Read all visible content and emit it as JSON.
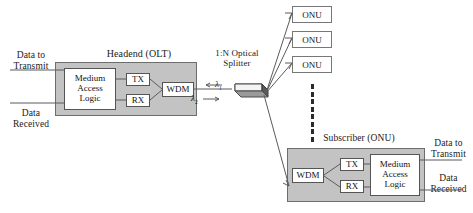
{
  "diagram": {
    "headend": {
      "title": "Headend (OLT)",
      "mac_label": "Medium\nAccess\nLogic",
      "tx_label": "TX",
      "rx_label": "RX",
      "wdm_label": "WDM",
      "left_top_label": "Data to\nTransmit",
      "left_bottom_label": "Data\nReceived"
    },
    "splitter": {
      "title": "1:N Optical\nSplitter",
      "lambda_up": "λ",
      "lambda_up_sub": "1",
      "lambda_down": "λ",
      "lambda_down_sub": "2",
      "arrow_up": "←",
      "arrow_down": "→"
    },
    "onus": [
      {
        "label": "ONU"
      },
      {
        "label": "ONU"
      },
      {
        "label": "ONU"
      }
    ],
    "ellipsis_dots": 8,
    "subscriber": {
      "title": "Subscriber (ONU)",
      "wdm_label": "WDM",
      "tx_label": "TX",
      "rx_label": "RX",
      "mac_label": "Medium\nAccess\nLogic",
      "right_top_label": "Data to\nTransmit",
      "right_bottom_label": "Data\nReceived"
    },
    "colors": {
      "unit_fill": "#c3c3c3",
      "unit_border": "#6d6d6d",
      "inner_fill": "#ffffff",
      "inner_border": "#555555",
      "line": "#5b5b5b",
      "text": "#1a1a1a",
      "splitter_top": "#d8d8d8",
      "splitter_end": "#5a5a5a",
      "background": "#ffffff"
    }
  }
}
